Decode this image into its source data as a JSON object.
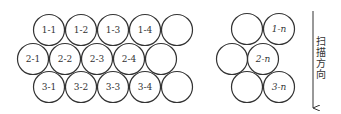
{
  "diagram": {
    "stroke_color": "#333333",
    "background": "#ffffff",
    "left_group": {
      "rows": [
        {
          "cells": [
            "1-1",
            "1-2",
            "1-3",
            "1-4",
            ""
          ]
        },
        {
          "cells": [
            "2-1",
            "2-2",
            "2-3",
            "2-4",
            ""
          ]
        },
        {
          "cells": [
            "3-1",
            "3-2",
            "3-3",
            "3-4",
            ""
          ]
        }
      ]
    },
    "right_group": {
      "rows": [
        {
          "cells": [
            "",
            "1-n"
          ]
        },
        {
          "cells": [
            "",
            "2-n"
          ]
        },
        {
          "cells": [
            "",
            "3-n"
          ]
        }
      ]
    },
    "scan_direction": {
      "label": "扫描方向",
      "label_chars": [
        "扫",
        "描",
        "方",
        "向"
      ],
      "arrow": "down"
    }
  }
}
